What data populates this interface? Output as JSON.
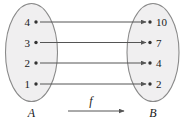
{
  "figure": {
    "type": "function-mapping-diagram",
    "background_color": "#ffffff",
    "set_fill_color": "#f0eff0",
    "set_stroke_color": "#8a8a8a",
    "arrow_color": "#555555",
    "text_color": "#1a1a1a"
  },
  "domain_set": {
    "label": "A",
    "elements": [
      {
        "value": "4"
      },
      {
        "value": "3"
      },
      {
        "value": "2"
      },
      {
        "value": "1"
      }
    ]
  },
  "codomain_set": {
    "label": "B",
    "elements": [
      {
        "value": "10"
      },
      {
        "value": "7"
      },
      {
        "value": "4"
      },
      {
        "value": "2"
      }
    ]
  },
  "mapping": {
    "label": "f",
    "pairs": [
      {
        "from": "4",
        "to": "10"
      },
      {
        "from": "3",
        "to": "7"
      },
      {
        "from": "2",
        "to": "4"
      },
      {
        "from": "1",
        "to": "2"
      }
    ]
  }
}
